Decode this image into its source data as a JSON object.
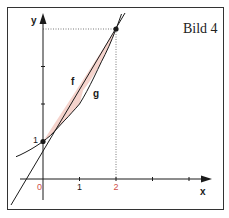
{
  "figure": {
    "title": "Bild 4",
    "axes": {
      "x_label": "x",
      "y_label": "y",
      "x_ticks": [
        {
          "value": 0,
          "label": "0",
          "color": "#d0504a"
        },
        {
          "value": 1,
          "label": "1",
          "color": "#1a1a1a"
        },
        {
          "value": 2,
          "label": "2",
          "color": "#d0504a"
        },
        {
          "value": 3,
          "label": "",
          "color": "#1a1a1a"
        },
        {
          "value": 4,
          "label": "",
          "color": "#1a1a1a"
        }
      ],
      "y_ticks": [
        {
          "value": 1,
          "label": "1"
        },
        {
          "value": 2,
          "label": ""
        },
        {
          "value": 3,
          "label": ""
        },
        {
          "value": 4,
          "label": ""
        }
      ]
    },
    "curves": [
      {
        "name": "f",
        "label": "f",
        "description": "straight line through (0,1) and (2,4)"
      },
      {
        "name": "g",
        "label": "g",
        "description": "convex curve through (0,1) and (2,4), y = 2^x"
      }
    ],
    "intersection_points": [
      {
        "x": 0,
        "y": 1
      },
      {
        "x": 2,
        "y": 4
      }
    ],
    "shaded_region": {
      "between": [
        "f",
        "g"
      ],
      "x_from": 0,
      "x_to": 2,
      "color": "#f5d3cc"
    },
    "colors": {
      "line": "#1a1a1a",
      "accent_label": "#d0504a",
      "fill": "#f5d3cc",
      "frame": "#333333"
    }
  }
}
